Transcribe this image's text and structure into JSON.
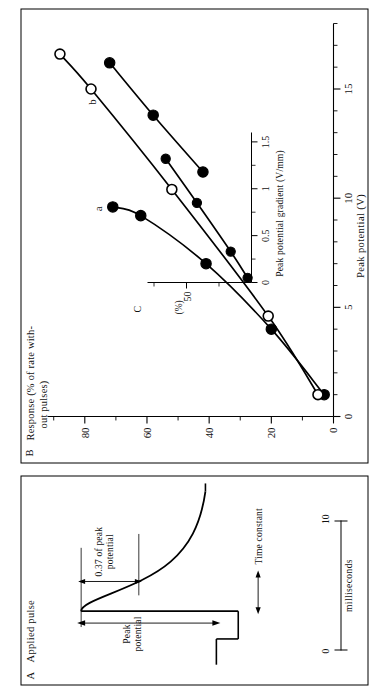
{
  "figure": {
    "background": "#ffffff",
    "ink": "#000000"
  },
  "panel_a": {
    "tag": "A",
    "title": "Applied pulse",
    "annotations": {
      "peak_potential": "Peak\npotential",
      "peak_potential_line1": "Peak",
      "peak_potential_line2": "potential",
      "fraction_line1": "0.37 of peak",
      "fraction_line2": "potential",
      "time_constant": "Time constant"
    },
    "scalebar": {
      "start_label": "0",
      "end_label": "10",
      "units": "milliseconds"
    }
  },
  "panel_b": {
    "tag": "B",
    "ylabel_line1": "Response (% of rate with-",
    "ylabel_line2": "out pulses)",
    "xlabel": "Peak potential   (V)",
    "y_ticks": [
      "0",
      "20",
      "40",
      "60",
      "80"
    ],
    "x_ticks": [
      "0",
      "5",
      "10",
      "15"
    ],
    "curve_labels": {
      "a": "a",
      "b": "b"
    }
  },
  "panel_c": {
    "tag": "C",
    "xlabel": "Peak potential gradient (V/mm)",
    "ylabel": "(%)",
    "x_ticks": [
      "0",
      "0.5",
      "1.0",
      "1.5"
    ],
    "y_ticks": [
      "50"
    ]
  },
  "chart_data": [
    {
      "type": "line",
      "id": "panel_b",
      "title": "B  Response vs Peak potential",
      "xlabel": "Peak potential (V)",
      "ylabel": "Response (% of rate without pulses)",
      "xlim": [
        0,
        18
      ],
      "ylim": [
        0,
        92
      ],
      "xticks": [
        0,
        5,
        10,
        15
      ],
      "yticks": [
        0,
        20,
        40,
        60,
        80
      ],
      "grid": false,
      "legend": [
        "a",
        "b"
      ],
      "series": [
        {
          "name": "a - filled circles",
          "marker": "filled-circle",
          "x": [
            1.0,
            4.0,
            7.0,
            9.2,
            9.6
          ],
          "y": [
            3.0,
            20.0,
            41.0,
            62.0,
            71.0
          ]
        },
        {
          "name": "a - open circles",
          "marker": "open-circle",
          "x": [
            1.0,
            4.6,
            10.4,
            15.0,
            16.6
          ],
          "y": [
            5.0,
            21.0,
            52.0,
            78.0,
            88.0
          ]
        },
        {
          "name": "b - filled circles",
          "marker": "filled-circle",
          "x": [
            11.2,
            13.8,
            16.2
          ],
          "y": [
            42.0,
            58.0,
            72.0
          ]
        }
      ]
    },
    {
      "type": "line",
      "id": "panel_c",
      "title": "C  Response vs Peak potential gradient",
      "xlabel": "Peak potential gradient (V/mm)",
      "ylabel": "(%)",
      "xlim": [
        0,
        1.6
      ],
      "ylim": [
        0,
        80
      ],
      "xticks": [
        0,
        0.5,
        1.0,
        1.5
      ],
      "yticks": [
        50
      ],
      "grid": false,
      "series": [
        {
          "name": "gradient response",
          "marker": "filled-circle",
          "x": [
            0.05,
            0.33,
            0.85,
            1.32
          ],
          "y": [
            3.0,
            16.0,
            42.0,
            66.0
          ]
        }
      ]
    }
  ]
}
